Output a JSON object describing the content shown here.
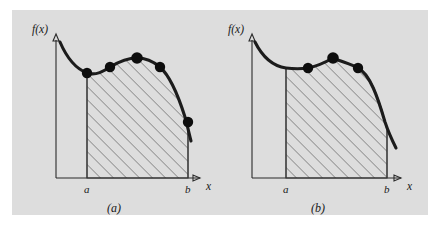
{
  "figure": {
    "background_color": "#ffffff",
    "panel_color": "#dddddd",
    "curve_color": "#1c1c1c",
    "dot_color": "#0d0d0d",
    "hatch_color": "#3c3c3c",
    "axis_color": "#2a2a2a"
  },
  "panels": [
    {
      "id": "a",
      "caption": "(a)",
      "y_axis_label": "f(x)",
      "x_axis_label": "x",
      "left_tick_label": "a",
      "right_tick_label": "b",
      "node_count": 5,
      "nodes": [
        {
          "x": 87,
          "y": 73
        },
        {
          "x": 110,
          "y": 67
        },
        {
          "x": 137,
          "y": 58
        },
        {
          "x": 160,
          "y": 67
        },
        {
          "x": 188,
          "y": 122
        }
      ],
      "curve_path": "M 60,42 C 66,56 74,68 87,73 C 96,76 104,71 110,67 C 120,61 128,58 137,58 C 147,58 154,62 160,67 C 170,76 179,98 185,117 C 187,124 189,133 191,141",
      "region_path": "M 87,73 C 96,76 104,71 110,67 C 120,61 128,58 137,58 C 147,58 154,62 160,67 C 170,76 179,98 185,117 C 187,124 188,128 188,131 L 188,178 L 87,178 Z",
      "axis_x_start": 56,
      "axis_x_end": 205,
      "axis_y_top": 34,
      "axis_baseline": 178,
      "axis_origin_x": 56,
      "tick_a_x": 87,
      "tick_b_x": 188
    },
    {
      "id": "b",
      "caption": "(b)",
      "y_axis_label": "f(x)",
      "x_axis_label": "x",
      "left_tick_label": "a",
      "right_tick_label": "b",
      "node_count": 3,
      "nodes": [
        {
          "x": 86,
          "y": 68
        },
        {
          "x": 111,
          "y": 58
        },
        {
          "x": 136,
          "y": 68
        }
      ],
      "curve_path": "M 33,42 C 40,56 50,66 64,68 C 72,69 79,69 86,68 C 96,66 104,62 111,58 C 120,62 129,64 136,68 C 148,74 156,98 163,122 C 167,134 171,142 174,148",
      "region_path": "M 64,68 C 72,69 79,69 86,68 C 96,66 104,62 111,58 C 120,62 129,64 136,68 C 148,74 154,92 160,110 C 162,118 164,125 165,131 L 165,178 L 64,178 Z",
      "axis_x_start": 30,
      "axis_x_end": 184,
      "axis_y_top": 34,
      "axis_baseline": 178,
      "axis_origin_x": 30,
      "tick_a_x": 64,
      "tick_b_x": 165
    }
  ]
}
